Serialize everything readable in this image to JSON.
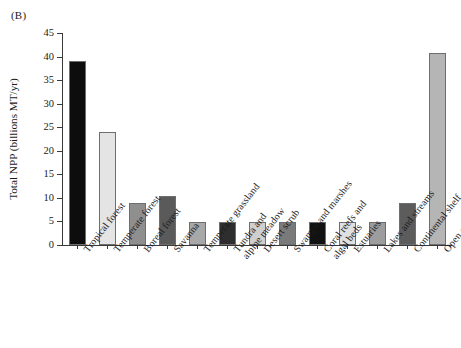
{
  "figure": {
    "panel_label": "(B)"
  },
  "chart_data": {
    "type": "bar",
    "title": "",
    "xlabel": "",
    "ylabel": "Total NPP (billions MT/yr)",
    "ylim": [
      0,
      45
    ],
    "yticks": [
      0,
      5,
      10,
      15,
      20,
      25,
      30,
      35,
      40,
      45
    ],
    "ytick_labels": [
      "0",
      "5",
      "10",
      "15",
      "20",
      "25",
      "30",
      "35",
      "40",
      "45"
    ],
    "grid": false,
    "legend": "none",
    "categories": [
      "Tropical forest",
      "Temperate forest",
      "Boreal forest",
      "Savanna",
      "Temperate grassland",
      "Tundra and alpine meadow",
      "Desert scrub",
      "Swamps and marshes",
      "Coral reefs and algal beds",
      "Estuaries",
      "Lakes and streams",
      "Continental shelf",
      "Open ocean"
    ],
    "category_lines": [
      [
        "Tropical forest"
      ],
      [
        "Temperate forest"
      ],
      [
        "Boreal forest"
      ],
      [
        "Savanna"
      ],
      [
        "Temperate grassland"
      ],
      [
        "Tundra and",
        "alpine meadow"
      ],
      [
        "Desert scrub"
      ],
      [
        "Swamps and marshes"
      ],
      [
        "Coral reefs and",
        "algal beds"
      ],
      [
        "Estuaries"
      ],
      [
        "Lakes and streams"
      ],
      [
        "Continental shelf"
      ],
      [
        "Open ocean"
      ]
    ],
    "values": [
      39.0,
      24.0,
      9.0,
      10.5,
      4.9,
      4.9,
      4.9,
      4.9,
      4.9,
      4.9,
      4.9,
      9.0,
      40.7
    ],
    "bar_colors": [
      "#0d0d0d",
      "#e4e4e4",
      "#8f8f8f",
      "#5a5a5a",
      "#a8a8a8",
      "#2e2e2e",
      "#cfcfcf",
      "#7a7a7a",
      "#121212",
      "#e0e0e0",
      "#9d9d9d",
      "#5c5c5c",
      "#b5b5b5"
    ],
    "bar_edge_color": "#6e6e6e",
    "axis_color": "#3a3a3a"
  }
}
